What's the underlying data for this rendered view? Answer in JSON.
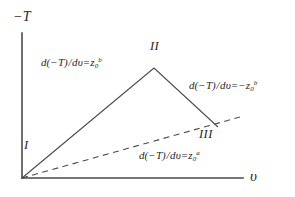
{
  "figure": {
    "type": "diagram",
    "background_color": "#ffffff",
    "line_color": "#3a3a3a"
  },
  "axes": {
    "y_label": "−T",
    "x_label": "υ",
    "y_axis": {
      "x": 22,
      "y_top": 33,
      "y_bottom": 178
    },
    "x_axis": {
      "y": 178,
      "x_left": 22,
      "x_right": 243
    }
  },
  "regions": [
    {
      "id": "I",
      "label": "I"
    },
    {
      "id": "II",
      "label": "II"
    },
    {
      "id": "III",
      "label": "III"
    }
  ],
  "formulas": {
    "left": {
      "numerator": "d(−T)",
      "denominator": "dυ",
      "equals": "=",
      "rhs_base": "z",
      "rhs_sub": "0",
      "rhs_sup": "b"
    },
    "right": {
      "numerator": "d(−T)",
      "denominator": "dυ",
      "equals": "=−",
      "rhs_base": "z",
      "rhs_sub": "0",
      "rhs_sup": "b"
    },
    "bottom": {
      "numerator": "d(−T)",
      "denominator": "dυ",
      "equals": "=",
      "rhs_base": "z",
      "rhs_sub": "0",
      "rhs_sup": "a"
    }
  },
  "chart_data": {
    "type": "line",
    "title": "",
    "xlabel": "υ",
    "ylabel": "−T",
    "grid": false,
    "legend": "none",
    "series": [
      {
        "name": "solid-path",
        "style": "solid",
        "points": [
          [
            22,
            178
          ],
          [
            154,
            68
          ],
          [
            218,
            127
          ]
        ]
      },
      {
        "name": "dashed-path",
        "style": "dashed",
        "points": [
          [
            22,
            178
          ],
          [
            240,
            117
          ]
        ]
      }
    ]
  }
}
